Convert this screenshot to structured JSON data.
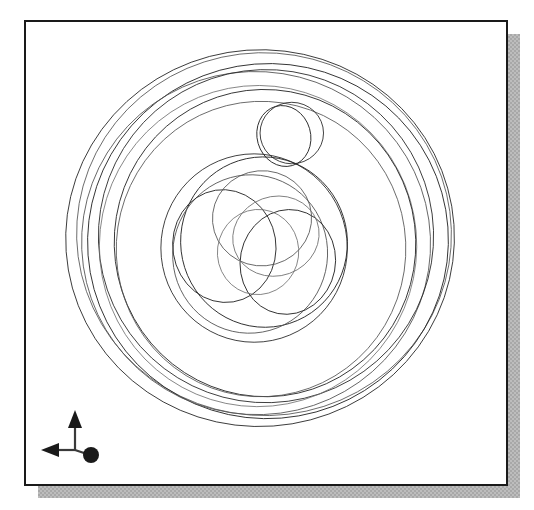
{
  "window": {
    "title": "",
    "background_color": "#ffffff"
  },
  "viewport": {
    "name": "cad-wireframe-viewport",
    "background_color": "#ffffff",
    "border_color": "#1a1a1a",
    "border_width_px": 2,
    "shadow_color": "#a8a8a8",
    "x": 24,
    "y": 20,
    "width": 484,
    "height": 466
  },
  "model": {
    "description": "wireframe hub / wheel assembly shown as overlapping circles and ellipses",
    "line_color": "#2b2b2b",
    "render_mode": "wireframe",
    "outer_rings": [
      {
        "name": "outer-rim-ring-1",
        "cx": 256,
        "cy": 232,
        "rx": 208,
        "ry": 200,
        "rotate": -4
      },
      {
        "name": "outer-rim-ring-2",
        "cx": 258,
        "cy": 230,
        "rx": 200,
        "ry": 193,
        "rotate": 3
      },
      {
        "name": "outer-rim-ring-3",
        "cx": 262,
        "cy": 234,
        "rx": 193,
        "ry": 188,
        "rotate": -9
      },
      {
        "name": "outer-rim-ring-4",
        "cx": 252,
        "cy": 236,
        "rx": 186,
        "ry": 182,
        "rotate": 8
      },
      {
        "name": "outer-rim-ring-5",
        "cx": 260,
        "cy": 228,
        "rx": 178,
        "ry": 176,
        "rotate": -2
      },
      {
        "name": "inner-rim-ring-1",
        "cx": 252,
        "cy": 238,
        "rx": 168,
        "ry": 170,
        "rotate": 5
      },
      {
        "name": "inner-rim-ring-2",
        "cx": 258,
        "cy": 236,
        "rx": 160,
        "ry": 163,
        "rotate": -6
      }
    ],
    "hub_circles": [
      {
        "name": "hub-outer-circle",
        "cx": 248,
        "cy": 242,
        "rx": 97,
        "ry": 98,
        "rotate": 0
      },
      {
        "name": "hub-ring-a",
        "cx": 256,
        "cy": 236,
        "rx": 86,
        "ry": 88,
        "rotate": -10
      },
      {
        "name": "hub-ring-b",
        "cx": 244,
        "cy": 246,
        "rx": 80,
        "ry": 82,
        "rotate": 12
      },
      {
        "name": "hub-bore-left",
        "cx": 216,
        "cy": 240,
        "rx": 54,
        "ry": 58,
        "rotate": -8
      },
      {
        "name": "hub-bore-right",
        "cx": 280,
        "cy": 254,
        "rx": 50,
        "ry": 54,
        "rotate": 10
      },
      {
        "name": "hub-bore-upper",
        "cx": 254,
        "cy": 212,
        "rx": 52,
        "ry": 50,
        "rotate": -4
      },
      {
        "name": "hub-inner-detail",
        "cx": 250,
        "cy": 244,
        "rx": 42,
        "ry": 44,
        "rotate": 6
      }
    ],
    "boss_circles": [
      {
        "name": "boss-hole-outer",
        "cx": 285,
        "cy": 128,
        "rx": 34,
        "ry": 33,
        "rotate": 0
      },
      {
        "name": "boss-hole-inner",
        "cx": 277,
        "cy": 131,
        "rx": 29,
        "ry": 32,
        "rotate": -14
      }
    ]
  },
  "axis_triad": {
    "name": "coordinate-axis-triad",
    "color": "#1a1a1a",
    "axes": [
      {
        "label": "",
        "name": "z-axis-up",
        "direction": "up",
        "marker": "arrow"
      },
      {
        "label": "",
        "name": "x-axis-left",
        "direction": "left",
        "marker": "arrow"
      },
      {
        "label": "",
        "name": "y-axis-toward-viewer",
        "direction": "out-of-screen",
        "marker": "dot"
      }
    ]
  }
}
